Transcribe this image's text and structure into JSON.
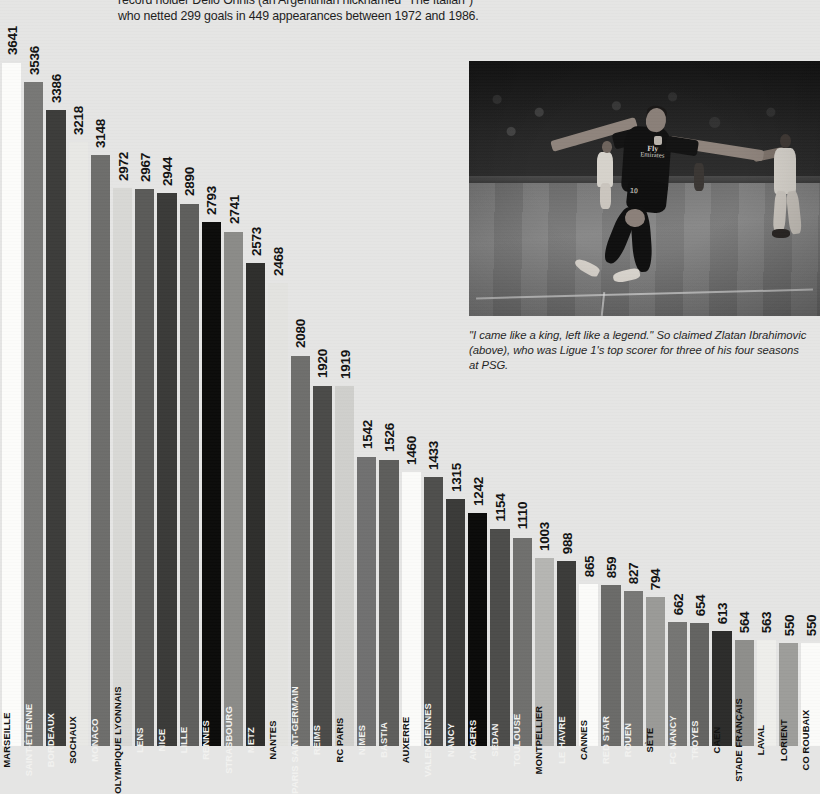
{
  "intro": {
    "text": "record holder Delio Onnis (an Argentinian nicknamed \"The Italian\")\nwho netted 299 goals in 449 appearances between 1972 and 1986."
  },
  "photo": {
    "alt_name": "zlatan-ibrahimovic-celebration-photo",
    "jersey_sponsor_small": "Fly",
    "jersey_sponsor_large": "Emirates",
    "jersey_number": "10",
    "caption": "\"I came like a king, left like a legend.\" So claimed Zlatan Ibrahimovic (above), who was Ligue 1's top scorer for three of his four seasons at PSG."
  },
  "clipped_axis_label": "3",
  "chart_data": {
    "type": "bar",
    "title": "",
    "xlabel": "",
    "ylabel": "",
    "ylim": [
      0,
      3700
    ],
    "grid": false,
    "legend": "none",
    "orientation": "vertical",
    "categories": [
      "MARSEILLE",
      "SAINT-ÉTIENNE",
      "BORDEAUX",
      "SOCHAUX",
      "MONACO",
      "OLYMPIQUE LYONNAIS",
      "LENS",
      "NICE",
      "LILLE",
      "RENNES",
      "STRASBOURG",
      "METZ",
      "NANTES",
      "PARIS SAINT-GERMAIN",
      "REIMS",
      "RC PARIS",
      "NIMES",
      "BASTIA",
      "AUXERRE",
      "VALENCIENNES",
      "NANCY",
      "ANGERS",
      "SEDAN",
      "TOULOUSE",
      "MONTPELLIER",
      "LE HAVRE",
      "CANNES",
      "RED STAR",
      "ROUEN",
      "SÈTE",
      "FC NANCY",
      "TROYES",
      "CAEN",
      "STADE FRANÇAIS",
      "LAVAL",
      "LORIENT",
      "CO ROUBAIX"
    ],
    "values": [
      3641,
      3536,
      3386,
      3218,
      3148,
      2972,
      2967,
      2944,
      2890,
      2793,
      2741,
      2573,
      2468,
      2080,
      1920,
      1919,
      1542,
      1526,
      1460,
      1433,
      1315,
      1242,
      1154,
      1110,
      1003,
      988,
      865,
      859,
      827,
      794,
      662,
      654,
      613,
      564,
      563,
      550,
      550
    ],
    "bar_colors": [
      "#fcfcfa",
      "#777775",
      "#3c3c3a",
      "#e8e8e5",
      "#6d6d6b",
      "#d8d8d5",
      "#5a5a58",
      "#3a3a38",
      "#5e5e5c",
      "#0b0b0a",
      "#8b8b88",
      "#2e2e2c",
      "#e3e3e0",
      "#6e6e6c",
      "#4a4a48",
      "#cfcfcc",
      "#707070",
      "#5d5d5b",
      "#fbfbf9",
      "#4e4e4c",
      "#3a3a38",
      "#0a0a09",
      "#4c4c4a",
      "#6f6f6d",
      "#b5b5b2",
      "#3b3b39",
      "#fbfbf9",
      "#6a6a68",
      "#777775",
      "#9a9a97",
      "#757573",
      "#636361",
      "#2c2c2a",
      "#8e8e8b",
      "#eeeeeb",
      "#9d9d9a",
      "#fbfbf9"
    ]
  },
  "layout": {
    "chart_left": 2,
    "bar_pitch": 22.2,
    "bar_width": 19.2,
    "axis_baseline_y": 746,
    "value_scale_px_per_unit": 0.1877,
    "label_band_height": 116
  }
}
